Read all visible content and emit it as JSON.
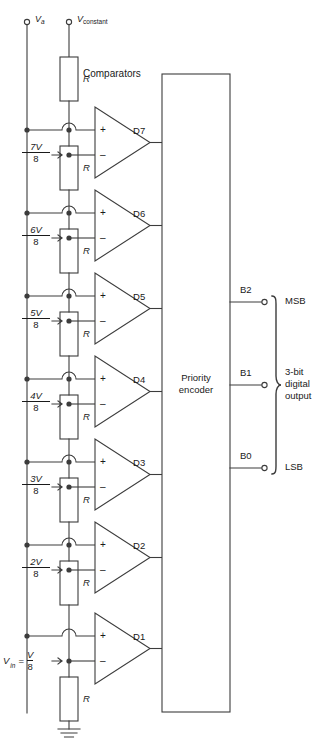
{
  "supplies": {
    "left_terminal": "V",
    "left_terminal_sub": "a",
    "right_terminal": "V",
    "right_terminal_sub": "constant"
  },
  "section_labels": {
    "comparators": "Comparators",
    "encoder_line1": "Priority",
    "encoder_line2": "encoder"
  },
  "resistors": [
    {
      "name": "R"
    },
    {
      "name": "R"
    },
    {
      "name": "R"
    },
    {
      "name": "R"
    },
    {
      "name": "R"
    },
    {
      "name": "R"
    },
    {
      "name": "R"
    },
    {
      "name": "R"
    }
  ],
  "resistor_label": "R",
  "taps": [
    {
      "num": "7V",
      "den": "8"
    },
    {
      "num": "6V",
      "den": "8"
    },
    {
      "num": "5V",
      "den": "8"
    },
    {
      "num": "4V",
      "den": "8"
    },
    {
      "num": "3V",
      "den": "8"
    },
    {
      "num": "2V",
      "den": "8"
    }
  ],
  "input_label": {
    "v": "V",
    "sub": "in",
    "eq": "=",
    "num": "V",
    "den": "8"
  },
  "comparators": [
    {
      "output": "D",
      "sub": "7",
      "plus": "+",
      "minus": "–"
    },
    {
      "output": "D",
      "sub": "6",
      "plus": "+",
      "minus": "–"
    },
    {
      "output": "D",
      "sub": "5",
      "plus": "+",
      "minus": "–"
    },
    {
      "output": "D",
      "sub": "4",
      "plus": "+",
      "minus": "–"
    },
    {
      "output": "D",
      "sub": "3",
      "plus": "+",
      "minus": "–"
    },
    {
      "output": "D",
      "sub": "2",
      "plus": "+",
      "minus": "–"
    },
    {
      "output": "D",
      "sub": "1",
      "plus": "+",
      "minus": "–"
    }
  ],
  "outputs": [
    {
      "name": "B",
      "sub": "2",
      "tag": "MSB"
    },
    {
      "name": "B",
      "sub": "1",
      "tag": ""
    },
    {
      "name": "B",
      "sub": "0",
      "tag": "LSB"
    }
  ],
  "output_group": {
    "line1": "3-bit",
    "line2": "digital",
    "line3": "output"
  },
  "colors": {
    "line": "#3c3c3c",
    "text": "#1a1a1a",
    "background": "#ffffff"
  }
}
